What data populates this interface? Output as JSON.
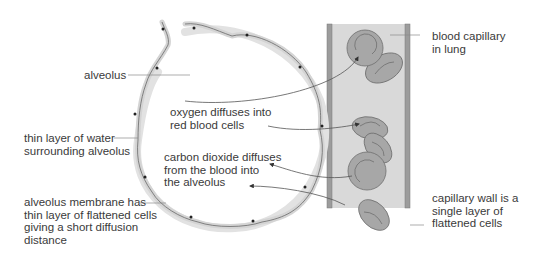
{
  "diagram": {
    "colors": {
      "background": "#ffffff",
      "wall_fill": "#d4d4d4",
      "wall_stroke": "#6a6a6a",
      "water_layer": "#e2e2e2",
      "capillary_fill": "#d9d9d9",
      "capillary_wall": "#9c9c9c",
      "rbc_fill": "#a7a7a7",
      "rbc_stroke": "#6e6e6e",
      "leader_line": "#8a8a8a",
      "arrow": "#555555",
      "text": "#3a3a3a"
    },
    "labels": {
      "alveolus": "alveolus",
      "water_layer": "thin layer of water\nsurrounding alveolus",
      "membrane": "alveolus membrane has\nthin layer of flattened cells\ngiving a short diffusion\ndistance",
      "oxygen": "oxygen diffuses into\nred blood cells",
      "co2": "carbon dioxide diffuses\nfrom the blood into\nthe alveolus",
      "capillary": "blood capillary\nin lung",
      "capillary_wall": "capillary wall is a\nsingle layer of\nflattened cells"
    }
  }
}
